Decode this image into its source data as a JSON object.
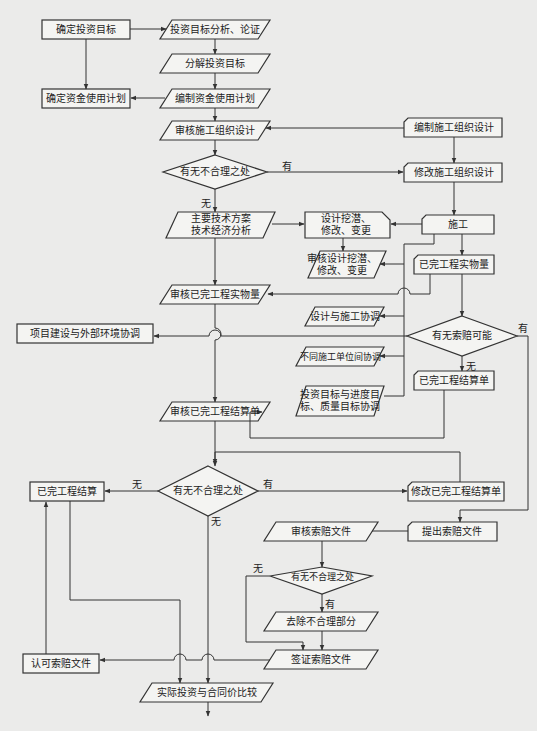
{
  "nodes": {
    "n1": "确定投资目标",
    "n2": "投资目标分析、论证",
    "n3": "分解投资目标",
    "n4": "确定资金使用计划",
    "n5": "编制资金使用计划",
    "n6": "审核施工组织设计",
    "n7": "编制施工组织设计",
    "n8": "有无不合理之处",
    "n9": "修改施工组织设计",
    "n10": "主要技术方案\n技术经济分析",
    "n11": "设计挖潜、\n修改、变更",
    "n12": "施工",
    "n13": "审核设计挖潜、\n修改、变更",
    "n14": "已完工程实物量",
    "n15": "审核已完工程实物量",
    "n16": "设计与施工协调",
    "n17": "项目建设与外部环境协调",
    "n18": "有无索赔可能",
    "n19": "不同施工单位间协调",
    "n20": "已完工程结算单",
    "n21": "投资目标与进度目\n标、质量目标协调",
    "n22": "审核已完工程结算单",
    "n23": "已完工程结算",
    "n24": "有无不合理之处",
    "n25": "修改已完工程结算单",
    "n26": "审核索赔文件",
    "n27": "提出索赔文件",
    "n28": "有无不合理之处",
    "n29": "去除不合理部分",
    "n30": "认可索赔文件",
    "n31": "签证索赔文件",
    "n32": "实际投资与合同价比较"
  },
  "edge_labels": {
    "yes": "有",
    "no": "无"
  },
  "caption": "图 投资控制流程图"
}
